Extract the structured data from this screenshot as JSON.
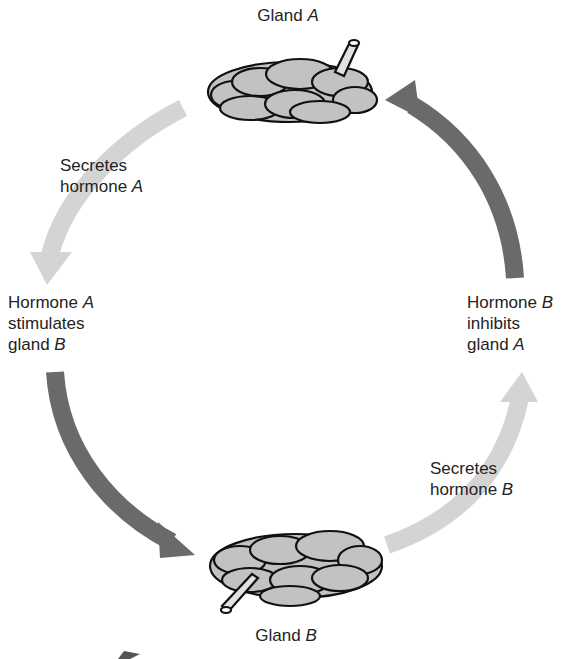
{
  "diagram": {
    "type": "negative-feedback-loop",
    "glands": {
      "a": {
        "label_prefix": "Gland ",
        "label_var": "A"
      },
      "b": {
        "label_prefix": "Gland ",
        "label_var": "B"
      }
    },
    "steps": {
      "secretes_a": {
        "line1": "Secretes",
        "line2_prefix": "hormone ",
        "line2_var": "A"
      },
      "stimulates": {
        "line1_prefix": "Hormone ",
        "line1_var": "A",
        "line2": "stimulates",
        "line3_prefix": "gland ",
        "line3_var": "B"
      },
      "secretes_b": {
        "line1": "Secretes",
        "line2_prefix": "hormone ",
        "line2_var": "B"
      },
      "inhibits": {
        "line1_prefix": "Hormone ",
        "line1_var": "B",
        "line2": "inhibits",
        "line3_prefix": "gland ",
        "line3_var": "A"
      }
    },
    "colors": {
      "light_arrow": "#d4d4d4",
      "dark_arrow": "#6a6a6a",
      "gland_fill": "#c2c2c2",
      "gland_stroke": "#111111"
    }
  }
}
